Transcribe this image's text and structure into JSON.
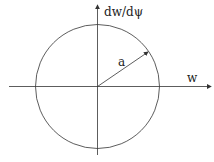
{
  "diagram": {
    "type": "phase-plane circle",
    "labels": {
      "y_axis": "dw/dψ",
      "x_axis": "w",
      "radius": "a"
    },
    "colors": {
      "stroke": "#333333",
      "background": "#ffffff"
    }
  }
}
